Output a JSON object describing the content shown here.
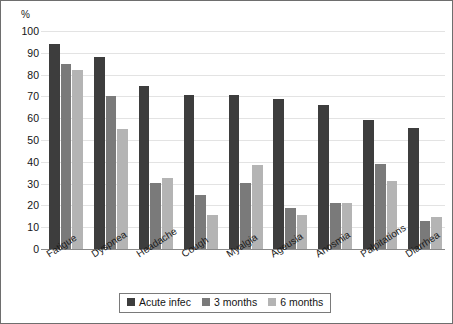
{
  "chart_data": {
    "type": "bar",
    "title": "",
    "subtitle": "",
    "xlabel": "",
    "ylabel": "%",
    "ylim": [
      0,
      100
    ],
    "ytick_step": 10,
    "yticks": [
      "0",
      "10",
      "20",
      "30",
      "40",
      "50",
      "60",
      "70",
      "80",
      "90",
      "100"
    ],
    "grid": true,
    "legend_position": "bottom",
    "categories": [
      "Fatigue",
      "Dyspnea",
      "Headache",
      "Cough",
      "Myalgia",
      "Ageusia",
      "Anosmia",
      "Palpitations",
      "Diarrhea"
    ],
    "series": [
      {
        "name": "Acute infec",
        "color": "#3d3d3d",
        "values": [
          94,
          88,
          75,
          70.5,
          70.5,
          69,
          66,
          59,
          55.5
        ]
      },
      {
        "name": "3 months",
        "color": "#7a7a7a",
        "values": [
          85,
          70,
          30.5,
          25,
          30.5,
          19,
          21,
          39,
          13
        ]
      },
      {
        "name": "6 months",
        "color": "#b4b4b4",
        "values": [
          82,
          55,
          32.5,
          15.5,
          38.5,
          15.5,
          21,
          31,
          14.5
        ]
      }
    ]
  },
  "colors": {
    "series_1": "#3d3d3d",
    "series_2": "#7a7a7a",
    "series_3": "#b4b4b4",
    "gridline": "#e3e3e3",
    "axis": "#8a8a8a",
    "frame_border": "#6e6e6e",
    "text": "#141414",
    "background": "#ffffff"
  }
}
